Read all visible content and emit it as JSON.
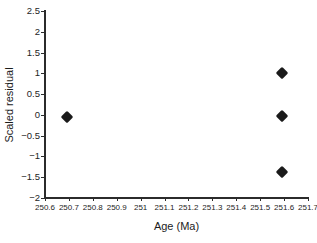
{
  "chart_data": {
    "type": "scatter",
    "title": "",
    "xlabel": "Age (Ma)",
    "ylabel": "Scaled residual",
    "xlim": [
      250.6,
      251.7
    ],
    "ylim": [
      -2,
      2.5
    ],
    "xticks": [
      250.6,
      250.7,
      250.8,
      250.9,
      251,
      251.1,
      251.2,
      251.3,
      251.4,
      251.5,
      251.6,
      251.7
    ],
    "xtick_labels": [
      "250.6",
      "250.7",
      "250.8",
      "250.9",
      "251",
      "251.1",
      "251.2",
      "251.3",
      "251.4",
      "251.5",
      "251.6",
      "251.7"
    ],
    "yticks": [
      -2,
      -1.5,
      -1,
      -0.5,
      0,
      0.5,
      1,
      1.5,
      2,
      2.5
    ],
    "ytick_labels": [
      "−2",
      "−1.5",
      "−1",
      "−0.5",
      "0",
      "0.5",
      "1",
      "1.5",
      "2",
      "2.5"
    ],
    "grid": false,
    "legend": "none",
    "marker": "filled-diamond",
    "marker_color": "#1a1a1a",
    "series": [
      {
        "name": "scaled residuals",
        "points": [
          {
            "x": 250.69,
            "y": -0.05
          },
          {
            "x": 251.59,
            "y": 1.0
          },
          {
            "x": 251.59,
            "y": -0.03
          },
          {
            "x": 251.59,
            "y": -1.38
          }
        ]
      }
    ]
  },
  "axes": {
    "xlabel": "Age (Ma)",
    "ylabel": "Scaled residual"
  },
  "colors": {
    "axis": "#2b2b2b",
    "text": "#1c1c1c",
    "marker": "#1a1a1a",
    "background": "#ffffff"
  }
}
